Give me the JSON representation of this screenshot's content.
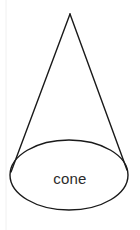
{
  "figure": {
    "kind": "geometry-diagram",
    "subject": "cone",
    "label": "cone",
    "label_color": "#2b2b2b",
    "label_font_size_px": 15,
    "label_center": {
      "x": 70,
      "y": 178
    },
    "background_color": "#ffffff",
    "stroke_color": "#1a1a1a",
    "stroke_width_px": 1.4,
    "fill": "none",
    "canvas": {
      "width": 140,
      "height": 230
    },
    "apex": {
      "x": 70,
      "y": 14
    },
    "base_ellipse": {
      "center_x": 69,
      "center_y": 175,
      "radius_x": 59,
      "radius_y": 35
    },
    "left_slant": {
      "x1": 70,
      "y1": 14,
      "x2": 11,
      "y2": 172
    },
    "right_slant": {
      "x1": 70,
      "y1": 14,
      "x2": 127,
      "y2": 170
    },
    "margin_rule": {
      "x": 6,
      "y_top": 0,
      "y_bottom": 230,
      "color": "#f0f0f0",
      "width_px": 1
    }
  }
}
